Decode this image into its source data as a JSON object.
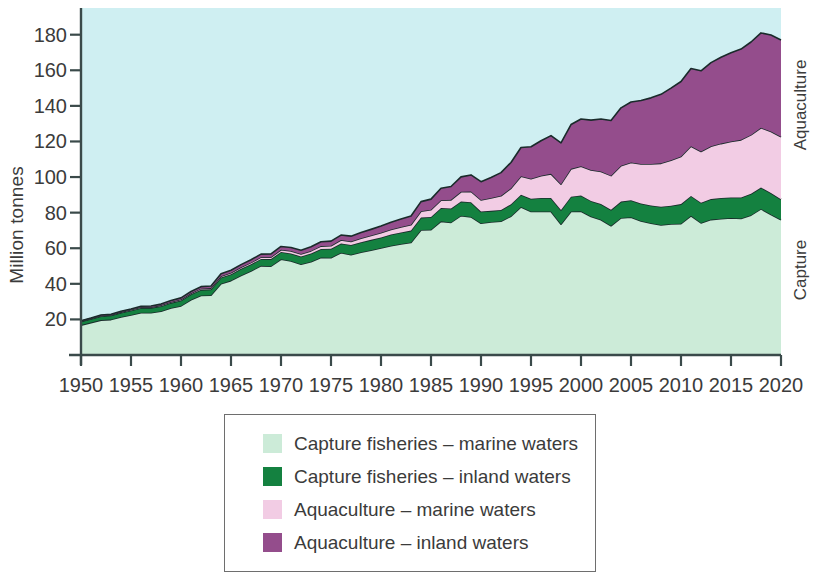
{
  "chart_data": {
    "type": "area",
    "stacked": true,
    "title": "",
    "subtitle": "",
    "xlabel": "",
    "ylabel": "Million tonnes",
    "ylim": [
      0,
      195
    ],
    "xlim": [
      1950,
      2020
    ],
    "grid": false,
    "legend_position": "bottom",
    "y_ticks": [
      20,
      40,
      60,
      80,
      100,
      120,
      140,
      160,
      180
    ],
    "x_ticks": [
      1950,
      1955,
      1960,
      1965,
      1970,
      1975,
      1980,
      1985,
      1990,
      1995,
      2000,
      2005,
      2010,
      2015,
      2020
    ],
    "x": [
      1950,
      1951,
      1952,
      1953,
      1954,
      1955,
      1956,
      1957,
      1958,
      1959,
      1960,
      1961,
      1962,
      1963,
      1964,
      1965,
      1966,
      1967,
      1968,
      1969,
      1970,
      1971,
      1972,
      1973,
      1974,
      1975,
      1976,
      1977,
      1978,
      1979,
      1980,
      1981,
      1982,
      1983,
      1984,
      1985,
      1986,
      1987,
      1988,
      1989,
      1990,
      1991,
      1992,
      1993,
      1994,
      1995,
      1996,
      1997,
      1998,
      1999,
      2000,
      2001,
      2002,
      2003,
      2004,
      2005,
      2006,
      2007,
      2008,
      2009,
      2010,
      2011,
      2012,
      2013,
      2014,
      2015,
      2016,
      2017,
      2018,
      2019,
      2020
    ],
    "series": [
      {
        "name": "Capture fisheries – marine waters",
        "color": "#CCEBD8",
        "values": [
          16.8,
          18.2,
          19.6,
          19.9,
          21.4,
          22.5,
          23.8,
          23.8,
          24.6,
          26.4,
          27.6,
          31.0,
          33.4,
          33.6,
          40.0,
          41.8,
          44.7,
          47.2,
          50.1,
          49.9,
          53.8,
          52.8,
          51.0,
          52.4,
          54.8,
          54.7,
          57.5,
          56.4,
          57.8,
          58.9,
          60.1,
          61.4,
          62.4,
          63.2,
          70.3,
          70.4,
          75.1,
          74.5,
          78.3,
          77.6,
          74.0,
          74.7,
          75.2,
          78.0,
          83.2,
          80.6,
          80.6,
          80.6,
          73.5,
          80.6,
          80.8,
          77.8,
          76.0,
          72.6,
          77.0,
          77.4,
          75.3,
          74.0,
          73.1,
          73.6,
          73.8,
          78.2,
          74.2,
          76.1,
          76.6,
          77.0,
          76.7,
          78.6,
          82.1,
          78.9,
          76.0
        ]
      },
      {
        "name": "Capture fisheries – inland waters",
        "color": "#148140",
        "values": [
          2.0,
          2.1,
          2.2,
          2.3,
          2.4,
          2.5,
          2.6,
          2.7,
          2.8,
          2.9,
          3.0,
          3.1,
          3.2,
          3.3,
          3.5,
          3.6,
          3.7,
          3.8,
          3.9,
          4.0,
          4.1,
          4.3,
          4.4,
          4.6,
          4.8,
          5.0,
          5.2,
          5.4,
          5.6,
          5.8,
          6.0,
          6.3,
          6.5,
          6.7,
          6.9,
          7.2,
          7.5,
          7.8,
          8.0,
          8.3,
          6.6,
          6.3,
          6.3,
          6.7,
          6.9,
          7.2,
          7.6,
          7.6,
          8.0,
          8.4,
          8.8,
          8.8,
          8.8,
          9.0,
          9.2,
          9.6,
          9.8,
          10.0,
          10.2,
          10.3,
          11.0,
          11.2,
          11.4,
          11.5,
          11.6,
          11.5,
          11.8,
          12.0,
          12.0,
          12.1,
          11.5
        ]
      },
      {
        "name": "Aquaculture – marine waters",
        "color": "#F2CCE4",
        "values": [
          0.2,
          0.2,
          0.3,
          0.3,
          0.3,
          0.4,
          0.4,
          0.4,
          0.5,
          0.5,
          0.6,
          0.6,
          0.7,
          0.7,
          0.8,
          0.8,
          0.9,
          0.9,
          1.0,
          1.1,
          1.2,
          1.3,
          1.4,
          1.5,
          1.6,
          1.7,
          1.9,
          2.0,
          2.2,
          2.4,
          2.6,
          2.8,
          3.0,
          3.3,
          3.6,
          4.0,
          4.4,
          4.9,
          5.4,
          6.0,
          6.5,
          7.2,
          8.0,
          9.0,
          10.3,
          11.3,
          12.5,
          13.6,
          14.5,
          15.6,
          16.5,
          17.4,
          18.3,
          19.2,
          20.2,
          21.2,
          22.3,
          23.3,
          24.4,
          25.6,
          26.8,
          27.9,
          28.8,
          29.7,
          30.6,
          31.5,
          32.4,
          33.1,
          33.6,
          34.6,
          35.1
        ]
      },
      {
        "name": "Aquaculture – inland waters",
        "color": "#944D8C",
        "values": [
          0.3,
          0.3,
          0.4,
          0.4,
          0.5,
          0.5,
          0.6,
          0.6,
          0.7,
          0.8,
          0.9,
          1.0,
          1.1,
          1.2,
          1.3,
          1.4,
          1.5,
          1.6,
          1.7,
          1.8,
          1.9,
          2.0,
          2.1,
          2.3,
          2.4,
          2.6,
          2.8,
          3.0,
          3.2,
          3.5,
          3.8,
          4.1,
          4.5,
          4.9,
          5.4,
          6.0,
          6.7,
          7.5,
          8.4,
          9.3,
          10.3,
          11.6,
          13.0,
          14.5,
          16.2,
          17.9,
          19.7,
          21.5,
          23.2,
          24.9,
          26.5,
          28.0,
          29.5,
          31.0,
          32.5,
          34.0,
          35.6,
          37.2,
          38.8,
          40.5,
          42.1,
          43.7,
          45.3,
          47.0,
          48.5,
          49.8,
          51.0,
          52.2,
          53.3,
          54.2,
          54.4
        ]
      }
    ]
  },
  "axes": {
    "y_title": "Million tonnes",
    "y_tick_labels": [
      "180",
      "160",
      "140",
      "120",
      "100",
      "80",
      "60",
      "40",
      "20"
    ],
    "x_tick_labels": [
      "1950",
      "1955",
      "1960",
      "1965",
      "1970",
      "1975",
      "1980",
      "1985",
      "1990",
      "1995",
      "2000",
      "2005",
      "2010",
      "2015",
      "2020"
    ]
  },
  "side_labels": {
    "aquaculture": "Aquaculture",
    "capture": "Capture"
  },
  "legend": {
    "items": [
      {
        "label": "Capture fisheries – marine waters",
        "color": "#CCEBD8"
      },
      {
        "label": "Capture fisheries – inland waters",
        "color": "#148140"
      },
      {
        "label": "Aquaculture – marine waters",
        "color": "#F2CCE4"
      },
      {
        "label": "Aquaculture – inland waters",
        "color": "#944D8C"
      }
    ]
  },
  "colors": {
    "plot_background": "#CFEFF2",
    "axis_line": "#3A4A4A",
    "series_outline": "#1A2B2B",
    "text": "#3B3B3B",
    "legend_border": "#6E6E6E"
  }
}
